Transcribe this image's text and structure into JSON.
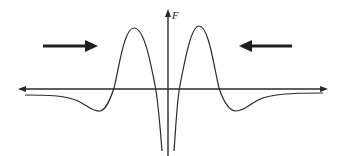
{
  "diagram": {
    "type": "force-distance curve",
    "axis_label_vertical": "F",
    "colors": {
      "line": "#2a2a2a",
      "arrow": "#1e1e1e",
      "background": "#ffffff"
    },
    "arrows": [
      {
        "name": "left-arrow",
        "direction": "right"
      },
      {
        "name": "right-arrow",
        "direction": "left"
      }
    ]
  }
}
